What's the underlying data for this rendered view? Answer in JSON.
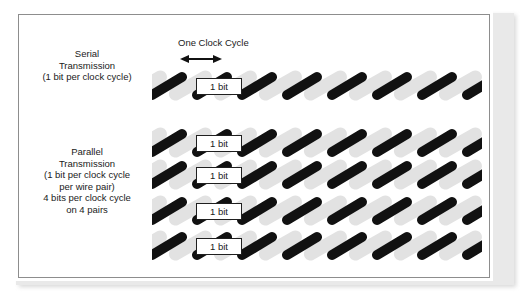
{
  "diagram": {
    "title_label": "One Clock Cycle",
    "arrow_icon": "double-headed-horizontal-arrow",
    "serial": {
      "lines": [
        "Serial",
        "Transmission",
        "(1 bit per clock cycle)"
      ],
      "row_count": 1,
      "bit_label": "1 bit"
    },
    "parallel": {
      "lines": [
        "Parallel",
        "Transmission",
        "(1 bit per clock cycle",
        "per wire pair)",
        "4 bits per clock cycle",
        "on 4 pairs"
      ],
      "row_count": 4,
      "bit_label": "1 bit"
    },
    "colors": {
      "wire_dark": "#111111",
      "wire_light": "#e2e2e2",
      "text": "#1a1a1a",
      "panel_border": "#8d8d8d",
      "background": "#ffffff"
    },
    "segments_per_row": 6
  }
}
